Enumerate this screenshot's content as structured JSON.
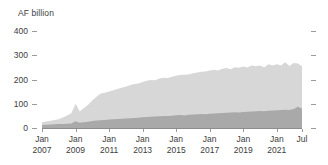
{
  "chart_data": {
    "type": "area",
    "stacked": true,
    "title": "",
    "subtitle": "",
    "xlabel": "",
    "ylabel": "AF billion",
    "ylim": [
      0,
      400
    ],
    "yticks": [
      0,
      100,
      200,
      300,
      400
    ],
    "ytick_labels": [
      "0",
      "100",
      "200",
      "300",
      "400"
    ],
    "grid": false,
    "legend_position": "none",
    "xtick_labels": [
      {
        "month": "Jan",
        "year": "2007"
      },
      {
        "month": "Jan",
        "year": "2009"
      },
      {
        "month": "Jan",
        "year": "2011"
      },
      {
        "month": "Jan",
        "year": "2013"
      },
      {
        "month": "Jan",
        "year": "2015"
      },
      {
        "month": "Jan",
        "year": "2017"
      },
      {
        "month": "Jan",
        "year": "2019"
      },
      {
        "month": "Jan",
        "year": "2021"
      },
      {
        "month": "Jul",
        "year": ""
      }
    ],
    "x_start": "Jan 2007",
    "x_end": "Jul 2022",
    "colors": {
      "series_lower": "#a9a9a9",
      "series_upper": "#d7d7d7",
      "axis": "#8d8d8d",
      "tick_mark": "#9a9a9a",
      "text": "#3c3c3c",
      "background": "#ffffff"
    },
    "x": [
      2007.0,
      2007.25,
      2007.5,
      2007.75,
      2008.0,
      2008.25,
      2008.5,
      2008.75,
      2009.0,
      2009.25,
      2009.5,
      2009.75,
      2010.0,
      2010.25,
      2010.5,
      2010.75,
      2011.0,
      2011.25,
      2011.5,
      2011.75,
      2012.0,
      2012.25,
      2012.5,
      2012.75,
      2013.0,
      2013.25,
      2013.5,
      2013.75,
      2014.0,
      2014.25,
      2014.5,
      2014.75,
      2015.0,
      2015.25,
      2015.5,
      2015.75,
      2016.0,
      2016.25,
      2016.5,
      2016.75,
      2017.0,
      2017.25,
      2017.5,
      2017.75,
      2018.0,
      2018.25,
      2018.5,
      2018.75,
      2019.0,
      2019.25,
      2019.5,
      2019.75,
      2020.0,
      2020.25,
      2020.5,
      2020.75,
      2021.0,
      2021.25,
      2021.5,
      2021.75,
      2022.0,
      2022.25,
      2022.5
    ],
    "series": [
      {
        "name": "lower-band",
        "color": "#a9a9a9",
        "values": [
          12,
          13,
          14,
          15,
          16,
          17,
          18,
          19,
          28,
          22,
          24,
          26,
          29,
          31,
          32,
          33,
          35,
          36,
          37,
          38,
          39,
          40,
          41,
          42,
          44,
          45,
          46,
          47,
          48,
          49,
          50,
          51,
          53,
          54,
          52,
          55,
          56,
          57,
          58,
          57,
          59,
          60,
          61,
          62,
          63,
          64,
          65,
          64,
          66,
          67,
          68,
          69,
          70,
          69,
          71,
          72,
          73,
          74,
          75,
          74,
          78,
          88,
          80
        ]
      },
      {
        "name": "upper-band",
        "color": "#d7d7d7",
        "values": [
          12,
          14,
          16,
          18,
          20,
          26,
          34,
          42,
          72,
          46,
          58,
          70,
          84,
          98,
          110,
          112,
          116,
          120,
          124,
          128,
          132,
          136,
          140,
          142,
          146,
          150,
          152,
          150,
          156,
          158,
          156,
          160,
          162,
          166,
          168,
          166,
          170,
          172,
          174,
          176,
          178,
          180,
          176,
          182,
          184,
          178,
          186,
          184,
          188,
          182,
          190,
          186,
          188,
          180,
          192,
          186,
          190,
          184,
          196,
          182,
          190,
          178,
          175
        ]
      }
    ],
    "total_values": [
      24,
      27,
      30,
      33,
      36,
      43,
      52,
      61,
      100,
      68,
      82,
      96,
      113,
      129,
      142,
      145,
      151,
      156,
      161,
      166,
      171,
      176,
      181,
      184,
      190,
      195,
      198,
      197,
      204,
      207,
      206,
      211,
      215,
      220,
      220,
      221,
      226,
      229,
      232,
      233,
      237,
      240,
      237,
      244,
      247,
      242,
      251,
      248,
      254,
      249,
      258,
      255,
      258,
      249,
      263,
      258,
      263,
      258,
      271,
      256,
      268,
      266,
      255
    ]
  }
}
